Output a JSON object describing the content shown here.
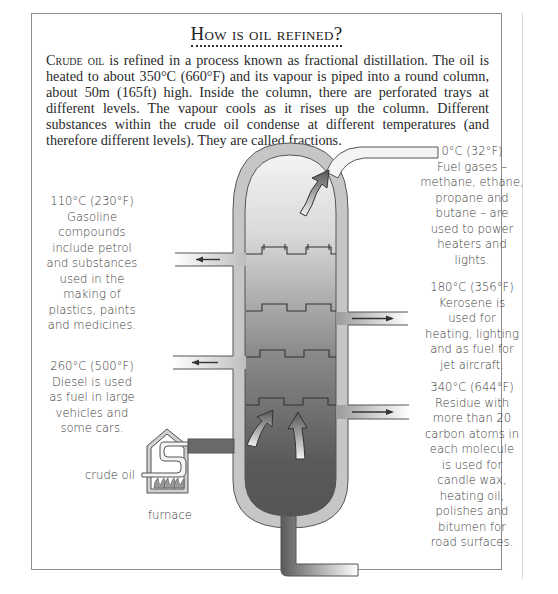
{
  "title": "How is oil refined?",
  "intro": {
    "lead": "Crude oil",
    "text": " is refined in a process known as fractional distillation. The oil is heated to about 350°C (660°F) and its vapour is piped into a round column, about 50m (165ft) high. Inside the column, there are perforated trays at different levels. The vapour cools as it rises up the column. Different substances within the crude oil condense at different temperatures (and therefore different levels). They are called fractions."
  },
  "fractions": [
    {
      "id": "fuel-gases",
      "temperature": "0°C (32°F)",
      "description": "Fuel gases – methane, ethane, propane and butane – are used to power heaters and lights."
    },
    {
      "id": "gasoline",
      "temperature": "110°C (230°F)",
      "description": "Gasoline compounds include petrol and substances used in the making of plastics, paints and medicines."
    },
    {
      "id": "kerosene",
      "temperature": "180°C (356°F)",
      "description": "Kerosene is used for heating, lighting and as fuel for jet aircraft."
    },
    {
      "id": "diesel",
      "temperature": "260°C (500°F)",
      "description": "Diesel is used as fuel in large vehicles and some cars."
    },
    {
      "id": "residue",
      "temperature": "340°C (644°F)",
      "description": "Residue with more than 20 carbon atoms in each molecule is used for candle wax, heating oil, polishes and bitumen for road surfaces."
    }
  ],
  "labels": {
    "crude_oil": "crude oil",
    "furnace": "furnace"
  },
  "colors": {
    "frame": "#8c8c8c",
    "column_wall": "#c4c4c4",
    "column_dark": "#5a5a5a",
    "column_light": "#eeeeee"
  }
}
